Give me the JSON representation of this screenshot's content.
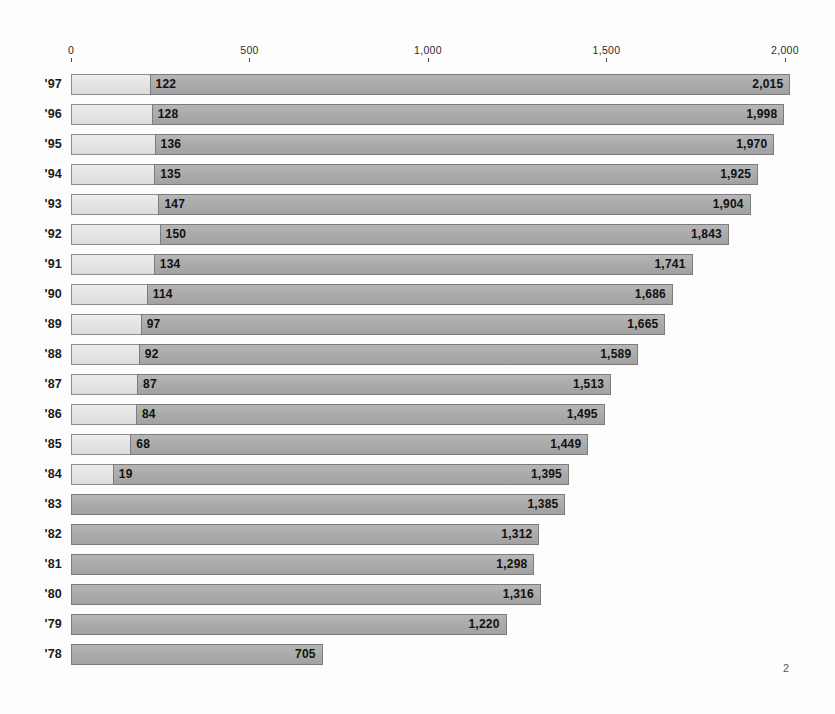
{
  "page": {
    "number": "2"
  },
  "chart_data": {
    "type": "bar",
    "orientation": "horizontal",
    "stacked": true,
    "title": "",
    "subtitle": "",
    "xlabel": "",
    "ylabel": "",
    "xlim": [
      0,
      2000
    ],
    "grid": false,
    "legend": null,
    "axis_ticks": [
      {
        "label": "0",
        "value": 0
      },
      {
        "label": "500",
        "value": 500
      },
      {
        "label": "1,000",
        "value": 1000
      },
      {
        "label": "1,500",
        "value": 1500
      },
      {
        "label": "2,000",
        "value": 2000
      }
    ],
    "categories": [
      "'97",
      "'96",
      "'95",
      "'94",
      "'93",
      "'92",
      "'91",
      "'90",
      "'89",
      "'88",
      "'87",
      "'86",
      "'85",
      "'84",
      "'83",
      "'82",
      "'81",
      "'80",
      "'79",
      "'78"
    ],
    "series": [
      {
        "name": "light-segment",
        "color": "#e3e3e3",
        "values": [
          122,
          128,
          136,
          135,
          147,
          150,
          134,
          114,
          97,
          92,
          87,
          84,
          68,
          19,
          0,
          0,
          0,
          0,
          0,
          0
        ],
        "labels": [
          "122",
          "128",
          "136",
          "135",
          "147",
          "150",
          "134",
          "114",
          "97",
          "92",
          "87",
          "84",
          "68",
          "19",
          "",
          "",
          "",
          "",
          "",
          ""
        ]
      },
      {
        "name": "total",
        "color": "#aaaaaa",
        "values": [
          2015,
          1998,
          1970,
          1925,
          1904,
          1843,
          1741,
          1686,
          1665,
          1589,
          1513,
          1495,
          1449,
          1395,
          1385,
          1312,
          1298,
          1316,
          1220,
          705
        ],
        "labels": [
          "2,015",
          "1,998",
          "1,970",
          "1,925",
          "1,904",
          "1,843",
          "1,741",
          "1,686",
          "1,665",
          "1,589",
          "1,513",
          "1,495",
          "1,449",
          "1,395",
          "1,385",
          "1,312",
          "1,298",
          "1,316",
          "1,220",
          "705"
        ]
      }
    ],
    "rows": [
      {
        "year": "'97",
        "light_value": 122,
        "light_label": "122",
        "total_value": 2015,
        "total_label": "2,015"
      },
      {
        "year": "'96",
        "light_value": 128,
        "light_label": "128",
        "total_value": 1998,
        "total_label": "1,998"
      },
      {
        "year": "'95",
        "light_value": 136,
        "light_label": "136",
        "total_value": 1970,
        "total_label": "1,970"
      },
      {
        "year": "'94",
        "light_value": 135,
        "light_label": "135",
        "total_value": 1925,
        "total_label": "1,925"
      },
      {
        "year": "'93",
        "light_value": 147,
        "light_label": "147",
        "total_value": 1904,
        "total_label": "1,904"
      },
      {
        "year": "'92",
        "light_value": 150,
        "light_label": "150",
        "total_value": 1843,
        "total_label": "1,843"
      },
      {
        "year": "'91",
        "light_value": 134,
        "light_label": "134",
        "total_value": 1741,
        "total_label": "1,741"
      },
      {
        "year": "'90",
        "light_value": 114,
        "light_label": "114",
        "total_value": 1686,
        "total_label": "1,686"
      },
      {
        "year": "'89",
        "light_value": 97,
        "light_label": "97",
        "total_value": 1665,
        "total_label": "1,665"
      },
      {
        "year": "'88",
        "light_value": 92,
        "light_label": "92",
        "total_value": 1589,
        "total_label": "1,589"
      },
      {
        "year": "'87",
        "light_value": 87,
        "light_label": "87",
        "total_value": 1513,
        "total_label": "1,513"
      },
      {
        "year": "'86",
        "light_value": 84,
        "light_label": "84",
        "total_value": 1495,
        "total_label": "1,495"
      },
      {
        "year": "'85",
        "light_value": 68,
        "light_label": "68",
        "total_value": 1449,
        "total_label": "1,449"
      },
      {
        "year": "'84",
        "light_value": 19,
        "light_label": "19",
        "total_value": 1395,
        "total_label": "1,395"
      },
      {
        "year": "'83",
        "light_value": 0,
        "light_label": "",
        "total_value": 1385,
        "total_label": "1,385"
      },
      {
        "year": "'82",
        "light_value": 0,
        "light_label": "",
        "total_value": 1312,
        "total_label": "1,312"
      },
      {
        "year": "'81",
        "light_value": 0,
        "light_label": "",
        "total_value": 1298,
        "total_label": "1,298"
      },
      {
        "year": "'80",
        "light_value": 0,
        "light_label": "",
        "total_value": 1316,
        "total_label": "1,316"
      },
      {
        "year": "'79",
        "light_value": 0,
        "light_label": "",
        "total_value": 1220,
        "total_label": "1,220"
      },
      {
        "year": "'78",
        "light_value": 0,
        "light_label": "",
        "total_value": 705,
        "total_label": "705"
      }
    ]
  }
}
